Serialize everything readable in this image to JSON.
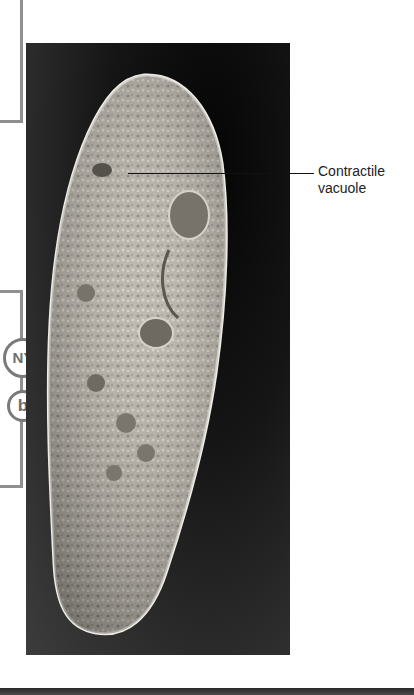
{
  "figure": {
    "callout": {
      "label_line1": "Contractile",
      "label_line2": "vacuole"
    }
  },
  "margin": {
    "badges": [
      {
        "label": "NY"
      },
      {
        "label": "b"
      }
    ]
  },
  "colors": {
    "frame_gray": "#8f8f8f",
    "badge_gray": "#7a7a7a",
    "photo_background": "#1a1a1a"
  }
}
